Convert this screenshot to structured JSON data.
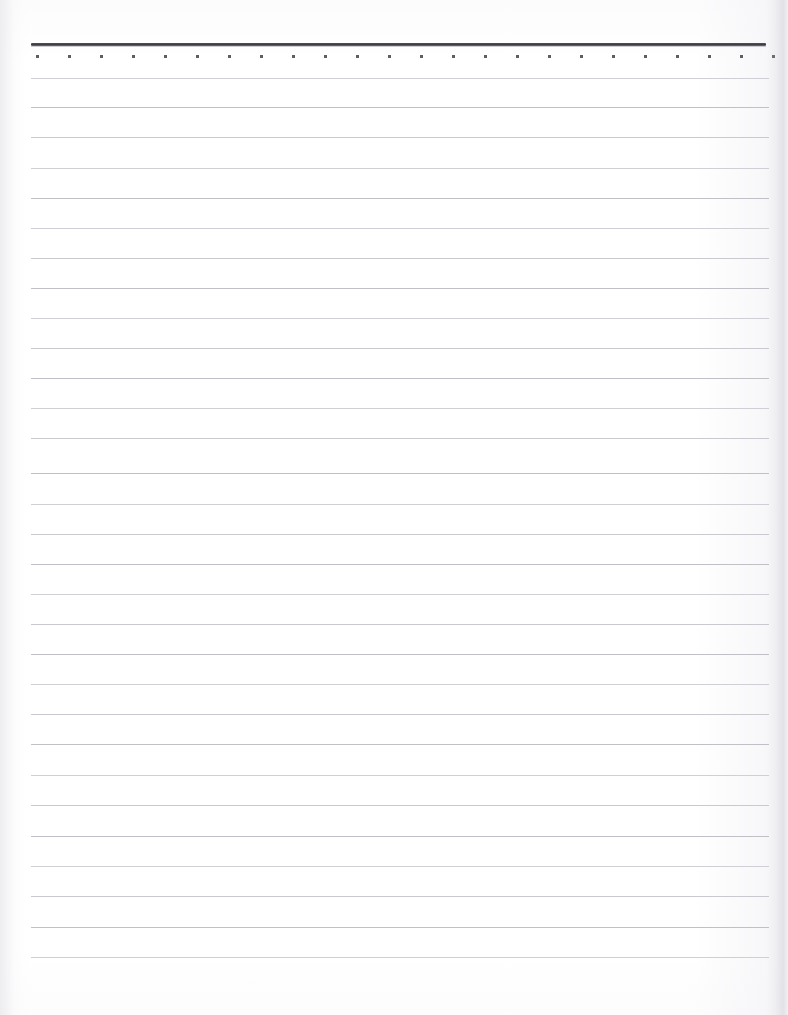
{
  "document": {
    "title": "Blank Lined Notebook Page",
    "page_width": 788,
    "page_height": 1015,
    "background_color": "#ffffff",
    "content_text": "",
    "note": "Unwritten ruled paper — no text content present"
  },
  "header_rule": {
    "name": "heavy-top-rule",
    "x": 31,
    "y": 43,
    "width": 735,
    "color": "#3a3a42",
    "thickness": 3
  },
  "dot_row": {
    "name": "perforation-dot-row",
    "y": 55,
    "start_x": 36,
    "spacing": 32,
    "count": 24,
    "dot_size": 3,
    "color": "#5d5d66"
  },
  "ruling": {
    "line_color": "#c6c6cc",
    "line_start_x": 31,
    "line_end_x": 769,
    "first_line_y": 78,
    "spacing": 30.3,
    "line_count": 30,
    "lines": [
      {
        "index": 1,
        "y": 78,
        "tint": "tint-a"
      },
      {
        "index": 2,
        "y": 107,
        "tint": "tint-b"
      },
      {
        "index": 3,
        "y": 137,
        "tint": "tint-c"
      },
      {
        "index": 4,
        "y": 168,
        "tint": "tint-a"
      },
      {
        "index": 5,
        "y": 198,
        "tint": "tint-b"
      },
      {
        "index": 6,
        "y": 228,
        "tint": "tint-a"
      },
      {
        "index": 7,
        "y": 258,
        "tint": "tint-c"
      },
      {
        "index": 8,
        "y": 288,
        "tint": "tint-b"
      },
      {
        "index": 9,
        "y": 318,
        "tint": "tint-a"
      },
      {
        "index": 10,
        "y": 348,
        "tint": "tint-c"
      },
      {
        "index": 11,
        "y": 378,
        "tint": "tint-b"
      },
      {
        "index": 12,
        "y": 408,
        "tint": "tint-a"
      },
      {
        "index": 13,
        "y": 438,
        "tint": "tint-c"
      },
      {
        "index": 14,
        "y": 473,
        "tint": "tint-b"
      },
      {
        "index": 15,
        "y": 504,
        "tint": "tint-a"
      },
      {
        "index": 16,
        "y": 534,
        "tint": "tint-c"
      },
      {
        "index": 17,
        "y": 564,
        "tint": "tint-b"
      },
      {
        "index": 18,
        "y": 594,
        "tint": "tint-a"
      },
      {
        "index": 19,
        "y": 624,
        "tint": "tint-c"
      },
      {
        "index": 20,
        "y": 654,
        "tint": "tint-b"
      },
      {
        "index": 21,
        "y": 684,
        "tint": "tint-a"
      },
      {
        "index": 22,
        "y": 714,
        "tint": "tint-c"
      },
      {
        "index": 23,
        "y": 744,
        "tint": "tint-b"
      },
      {
        "index": 24,
        "y": 775,
        "tint": "tint-a"
      },
      {
        "index": 25,
        "y": 805,
        "tint": "tint-c"
      },
      {
        "index": 26,
        "y": 836,
        "tint": "tint-b"
      },
      {
        "index": 27,
        "y": 866,
        "tint": "tint-a"
      },
      {
        "index": 28,
        "y": 896,
        "tint": "tint-c"
      },
      {
        "index": 29,
        "y": 927,
        "tint": "tint-b"
      },
      {
        "index": 30,
        "y": 957,
        "tint": "tint-a"
      }
    ]
  }
}
